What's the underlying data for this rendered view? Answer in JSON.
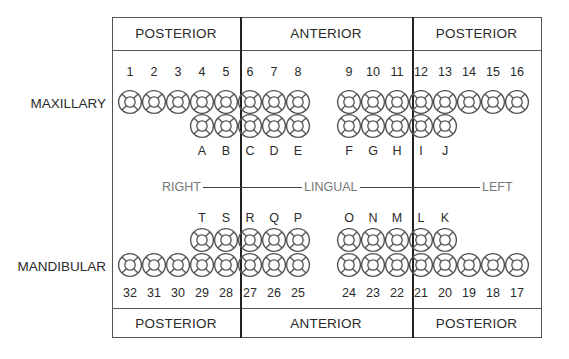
{
  "sections": {
    "top": [
      {
        "label": "POSTERIOR",
        "x1": 112,
        "x2": 240
      },
      {
        "label": "ANTERIOR",
        "x1": 240,
        "x2": 412
      },
      {
        "label": "POSTERIOR",
        "x1": 412,
        "x2": 541
      }
    ],
    "bottom": [
      {
        "label": "POSTERIOR",
        "x1": 112,
        "x2": 240
      },
      {
        "label": "ANTERIOR",
        "x1": 240,
        "x2": 412
      },
      {
        "label": "POSTERIOR",
        "x1": 412,
        "x2": 541
      }
    ]
  },
  "arch_labels": {
    "maxillary": "MAXILLARY",
    "mandibular": "MANDIBULAR"
  },
  "orientation": {
    "right": "RIGHT",
    "lingual": "LINGUAL",
    "left": "LEFT"
  },
  "maxillary_permanent": [
    "1",
    "2",
    "3",
    "4",
    "5",
    "6",
    "7",
    "8",
    "9",
    "10",
    "11",
    "12",
    "13",
    "14",
    "15",
    "16"
  ],
  "maxillary_primary": [
    "A",
    "B",
    "C",
    "D",
    "E",
    "F",
    "G",
    "H",
    "I",
    "J"
  ],
  "mandibular_primary": [
    "T",
    "S",
    "R",
    "Q",
    "P",
    "O",
    "N",
    "M",
    "L",
    "K"
  ],
  "mandibular_permanent": [
    "32",
    "31",
    "30",
    "29",
    "28",
    "27",
    "26",
    "25",
    "24",
    "23",
    "22",
    "21",
    "20",
    "19",
    "18",
    "17"
  ],
  "colors": {
    "tooth_stroke": "#555555",
    "frame": "#555555",
    "divider": "#222222",
    "orientation_text": "#777777"
  }
}
